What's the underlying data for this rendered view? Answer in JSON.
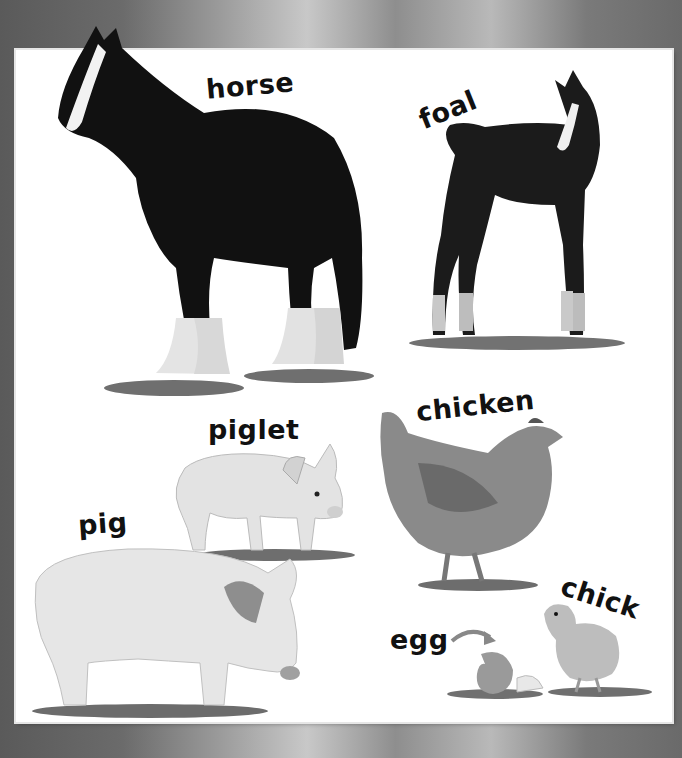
{
  "page": {
    "colors": {
      "background_frame": "#8a8a8a",
      "panel": "#ffffff",
      "label_text": "#111111"
    }
  },
  "animals": [
    {
      "id": "horse",
      "label": "horse",
      "description": "Black draft horse with white blaze and feathered white legs"
    },
    {
      "id": "foal",
      "label": "foal",
      "description": "Dark foal with white blaze and white socks"
    },
    {
      "id": "piglet",
      "label": "piglet",
      "description": "Pale young piglet standing"
    },
    {
      "id": "pig",
      "label": "pig",
      "description": "Large pale pig standing on grass"
    },
    {
      "id": "chicken",
      "label": "chicken",
      "description": "Brown hen standing on grass"
    },
    {
      "id": "egg",
      "label": "egg",
      "description": "Cracked eggshell with arrow pointing to it"
    },
    {
      "id": "chick",
      "label": "chick",
      "description": "Fluffy yellow chick beside hatched eggshell"
    }
  ]
}
